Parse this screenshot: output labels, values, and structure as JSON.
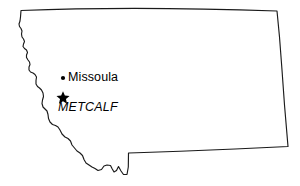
{
  "figure": {
    "width": 300,
    "height": 186,
    "background_color": "#ffffff",
    "outline_color": "#1a1a1a",
    "marker_color": "#000000"
  },
  "map": {
    "region_name": "Montana",
    "outline_style": "state-boundary-line"
  },
  "markers": [
    {
      "id": "missoula",
      "label": "Missoula",
      "symbol": "dot",
      "icon_name": "city-dot-icon",
      "x": 63,
      "y": 78,
      "label_position": "right"
    },
    {
      "id": "metcalf",
      "label": "METCALF",
      "symbol": "star",
      "icon_name": "site-star-icon",
      "x": 63,
      "y": 97,
      "label_position": "below",
      "label_style": "italic"
    }
  ]
}
